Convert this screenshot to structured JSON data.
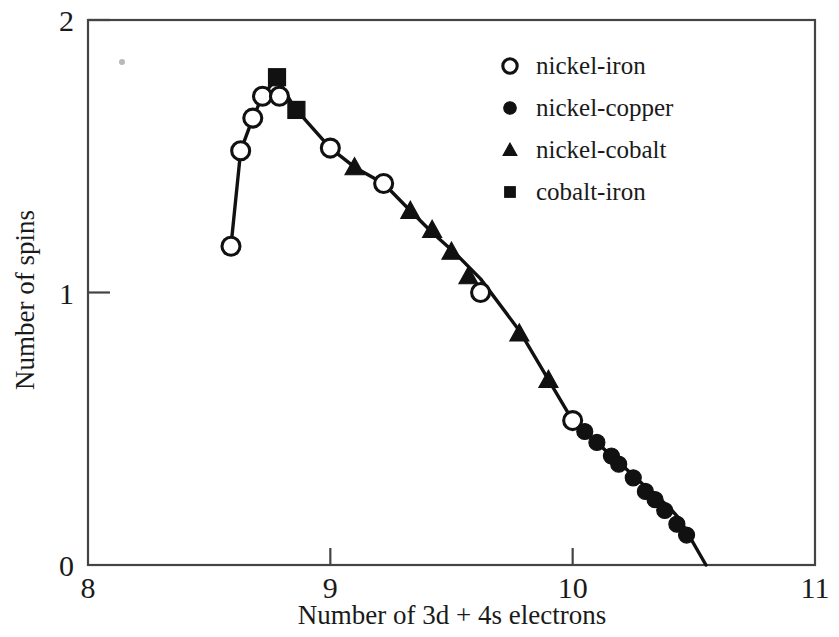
{
  "chart_data": {
    "type": "line",
    "title": "",
    "subtitle": "",
    "xlabel": "Number of 3d + 4s electrons",
    "ylabel": "Number of spins",
    "xlim": [
      8,
      11
    ],
    "ylim": [
      0,
      2
    ],
    "xticks": [
      8,
      9,
      10,
      11
    ],
    "xtick_labels": [
      "8",
      "9",
      "10",
      "11"
    ],
    "yticks": [
      0,
      1,
      2
    ],
    "ytick_labels": [
      "0",
      "1",
      "2"
    ],
    "grid": false,
    "legend_position": "top-right",
    "annotations": [],
    "slater_pauling_curve": {
      "description": "Slater-Pauling curve: mean atomic magnetic moment (number of spins) versus number of 3d + 4s electrons",
      "x": [
        8.59,
        8.63,
        8.68,
        8.72,
        8.78,
        8.85,
        9.0,
        9.1,
        9.22,
        9.33,
        9.42,
        9.52,
        9.62,
        9.78,
        10.0,
        10.05,
        10.1,
        10.16,
        10.2,
        10.26,
        10.31,
        10.35,
        10.4,
        10.44,
        10.55
      ],
      "y": [
        1.17,
        1.52,
        1.64,
        1.72,
        1.79,
        1.68,
        1.53,
        1.46,
        1.4,
        1.3,
        1.22,
        1.14,
        1.05,
        0.86,
        0.53,
        0.49,
        0.45,
        0.4,
        0.37,
        0.32,
        0.28,
        0.25,
        0.21,
        0.17,
        0.0
      ]
    },
    "series": [
      {
        "name": "nickel-iron",
        "marker": "open-circle",
        "color": "#111111",
        "points": [
          {
            "x": 8.59,
            "y": 1.17
          },
          {
            "x": 8.63,
            "y": 1.52
          },
          {
            "x": 8.68,
            "y": 1.64
          },
          {
            "x": 8.72,
            "y": 1.72
          },
          {
            "x": 8.79,
            "y": 1.72
          },
          {
            "x": 9.0,
            "y": 1.53
          },
          {
            "x": 9.22,
            "y": 1.4
          },
          {
            "x": 9.62,
            "y": 1.0
          },
          {
            "x": 10.0,
            "y": 0.53
          }
        ]
      },
      {
        "name": "nickel-copper",
        "marker": "filled-circle",
        "color": "#111111",
        "points": [
          {
            "x": 10.05,
            "y": 0.49
          },
          {
            "x": 10.1,
            "y": 0.45
          },
          {
            "x": 10.16,
            "y": 0.4
          },
          {
            "x": 10.19,
            "y": 0.37
          },
          {
            "x": 10.25,
            "y": 0.32
          },
          {
            "x": 10.3,
            "y": 0.27
          },
          {
            "x": 10.34,
            "y": 0.24
          },
          {
            "x": 10.38,
            "y": 0.2
          },
          {
            "x": 10.43,
            "y": 0.15
          },
          {
            "x": 10.47,
            "y": 0.11
          }
        ]
      },
      {
        "name": "nickel-cobalt",
        "marker": "filled-triangle",
        "color": "#111111",
        "points": [
          {
            "x": 9.1,
            "y": 1.46
          },
          {
            "x": 9.33,
            "y": 1.3
          },
          {
            "x": 9.42,
            "y": 1.23
          },
          {
            "x": 9.5,
            "y": 1.15
          },
          {
            "x": 9.57,
            "y": 1.06
          },
          {
            "x": 9.78,
            "y": 0.85
          },
          {
            "x": 9.9,
            "y": 0.68
          }
        ]
      },
      {
        "name": "cobalt-iron",
        "marker": "filled-square",
        "color": "#111111",
        "points": [
          {
            "x": 8.78,
            "y": 1.79
          },
          {
            "x": 8.86,
            "y": 1.67
          }
        ]
      }
    ]
  },
  "legend": {
    "items": [
      {
        "label": "nickel-iron",
        "marker": "open-circle"
      },
      {
        "label": "nickel-copper",
        "marker": "filled-circle"
      },
      {
        "label": "nickel-cobalt",
        "marker": "filled-triangle"
      },
      {
        "label": "cobalt-iron",
        "marker": "filled-square"
      }
    ]
  },
  "axes": {
    "x_title": "Number of 3d + 4s electrons",
    "y_title": "Number of spins",
    "x_labels": [
      "8",
      "9",
      "10",
      "11"
    ],
    "y_labels": [
      "0",
      "1",
      "2"
    ]
  },
  "style": {
    "background": "#ffffff",
    "ink": "#111111",
    "frame": "#444444"
  }
}
